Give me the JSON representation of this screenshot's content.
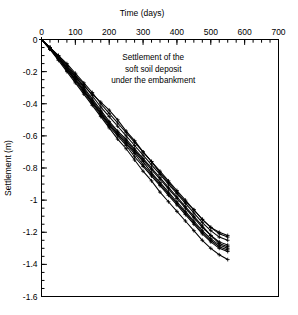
{
  "chart_data": {
    "type": "line",
    "title": "",
    "xlabel": "Time (days)",
    "ylabel": "Settlement (m)",
    "xlim": [
      0,
      700
    ],
    "ylim": [
      -1.6,
      0
    ],
    "xticks": [
      0,
      100,
      200,
      300,
      400,
      500,
      600,
      700
    ],
    "xticklabels": [
      "0",
      "100",
      "200",
      "300",
      "400",
      "500",
      "600",
      "700"
    ],
    "xminor_interval": 25,
    "yticks": [
      0,
      -0.2,
      -0.4,
      -0.6,
      -0.8,
      -1,
      -1.2,
      -1.4,
      -1.6
    ],
    "yticklabels": [
      "0",
      "-0.2",
      "-0.4",
      "-0.6",
      "-0.8",
      "-1",
      "-1.2",
      "-1.4",
      "-1.6"
    ],
    "yminor_interval": 0.05,
    "grid": false,
    "legend": false,
    "marker": "plus",
    "line_color": "#000000",
    "annotations": [
      {
        "text": "Settlement of the soft soil deposit under the embankment",
        "x": 330,
        "y": -0.13
      }
    ],
    "x": [
      0,
      25,
      50,
      75,
      100,
      125,
      150,
      175,
      200,
      225,
      250,
      275,
      300,
      325,
      350,
      375,
      400,
      425,
      450,
      475,
      500,
      525,
      550
    ],
    "series": [
      {
        "name": "S1",
        "values": [
          0,
          -0.05,
          -0.11,
          -0.17,
          -0.23,
          -0.3,
          -0.37,
          -0.44,
          -0.51,
          -0.57,
          -0.62,
          -0.68,
          -0.74,
          -0.8,
          -0.86,
          -0.92,
          -0.98,
          -1.04,
          -1.1,
          -1.16,
          -1.22,
          -1.27,
          -1.29
        ]
      },
      {
        "name": "S2",
        "values": [
          0,
          -0.06,
          -0.12,
          -0.18,
          -0.25,
          -0.32,
          -0.39,
          -0.46,
          -0.53,
          -0.59,
          -0.65,
          -0.71,
          -0.78,
          -0.84,
          -0.9,
          -0.96,
          -1.02,
          -1.08,
          -1.14,
          -1.2,
          -1.25,
          -1.29,
          -1.31
        ]
      },
      {
        "name": "S3",
        "values": [
          0,
          -0.05,
          -0.1,
          -0.16,
          -0.22,
          -0.28,
          -0.35,
          -0.42,
          -0.48,
          -0.54,
          -0.6,
          -0.66,
          -0.72,
          -0.78,
          -0.84,
          -0.9,
          -0.96,
          -1.02,
          -1.08,
          -1.14,
          -1.19,
          -1.23,
          -1.25
        ]
      },
      {
        "name": "S4",
        "values": [
          0,
          -0.06,
          -0.13,
          -0.2,
          -0.27,
          -0.34,
          -0.41,
          -0.48,
          -0.55,
          -0.62,
          -0.68,
          -0.75,
          -0.82,
          -0.88,
          -0.95,
          -1.01,
          -1.07,
          -1.13,
          -1.19,
          -1.25,
          -1.3,
          -1.34,
          -1.37
        ]
      },
      {
        "name": "S5",
        "values": [
          0,
          -0.05,
          -0.11,
          -0.17,
          -0.23,
          -0.29,
          -0.34,
          -0.39,
          -0.44,
          -0.5,
          -0.57,
          -0.63,
          -0.7,
          -0.76,
          -0.83,
          -0.89,
          -0.95,
          -1.01,
          -1.06,
          -1.12,
          -1.17,
          -1.21,
          -1.23
        ]
      },
      {
        "name": "S6",
        "values": [
          0,
          -0.06,
          -0.12,
          -0.19,
          -0.26,
          -0.33,
          -0.4,
          -0.47,
          -0.54,
          -0.6,
          -0.66,
          -0.73,
          -0.79,
          -0.85,
          -0.91,
          -0.97,
          -1.03,
          -1.09,
          -1.15,
          -1.21,
          -1.26,
          -1.3,
          -1.32
        ]
      },
      {
        "name": "S7",
        "values": [
          0,
          -0.05,
          -0.11,
          -0.18,
          -0.24,
          -0.31,
          -0.38,
          -0.45,
          -0.52,
          -0.58,
          -0.63,
          -0.69,
          -0.75,
          -0.81,
          -0.87,
          -0.93,
          -0.99,
          -1.05,
          -1.11,
          -1.17,
          -1.22,
          -1.26,
          -1.28
        ]
      },
      {
        "name": "S8",
        "values": [
          0,
          -0.06,
          -0.12,
          -0.19,
          -0.25,
          -0.32,
          -0.39,
          -0.46,
          -0.53,
          -0.59,
          -0.64,
          -0.7,
          -0.76,
          -0.83,
          -0.89,
          -0.95,
          -1.01,
          -1.07,
          -1.13,
          -1.19,
          -1.24,
          -1.28,
          -1.3
        ]
      },
      {
        "name": "S9",
        "values": [
          0,
          -0.05,
          -0.1,
          -0.15,
          -0.21,
          -0.27,
          -0.33,
          -0.4,
          -0.46,
          -0.52,
          -0.58,
          -0.64,
          -0.7,
          -0.76,
          -0.82,
          -0.88,
          -0.94,
          -1.0,
          -1.06,
          -1.12,
          -1.17,
          -1.2,
          -1.22
        ]
      }
    ]
  }
}
